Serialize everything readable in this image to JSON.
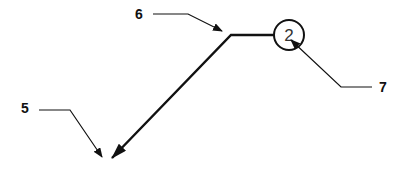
{
  "diagram": {
    "callouts": [
      {
        "id": "5",
        "label": "5"
      },
      {
        "id": "6",
        "label": "6"
      },
      {
        "id": "7",
        "label": "7"
      }
    ],
    "item_number": "2",
    "colors": {
      "line": "#111111",
      "background": "#ffffff"
    }
  }
}
